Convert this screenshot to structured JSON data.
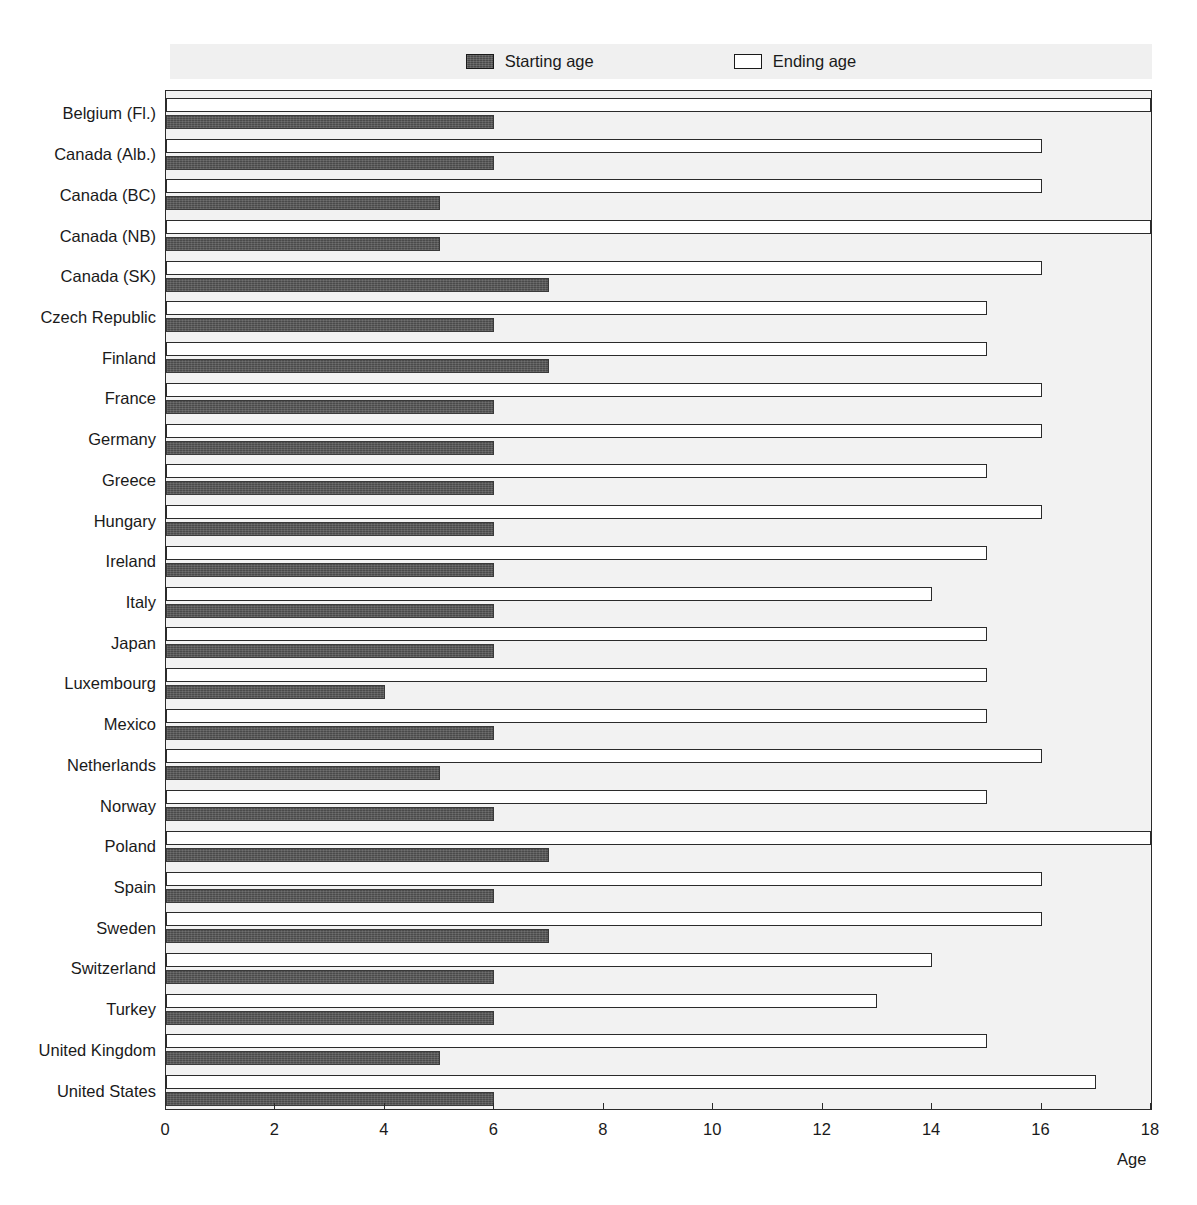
{
  "legend": {
    "items": [
      {
        "label": "Starting age",
        "swatch": "filled-dark"
      },
      {
        "label": "Ending age",
        "swatch": "outlined-white"
      }
    ]
  },
  "axis": {
    "x_title": "Age",
    "x_ticks": [
      "0",
      "2",
      "4",
      "6",
      "8",
      "10",
      "12",
      "14",
      "16",
      "18"
    ]
  },
  "colors": {
    "starting_bar": "#4a4a4a",
    "ending_bar": "#ffffff",
    "bar_outline": "#2b2b2b",
    "plot_background": "#f2f2f2",
    "legend_background": "#f0f0f0",
    "text": "#1a1a1a"
  },
  "chart_data": {
    "type": "bar",
    "orientation": "horizontal",
    "title": "",
    "xlabel": "Age",
    "ylabel": "",
    "xlim": [
      0,
      18
    ],
    "xticks": [
      0,
      2,
      4,
      6,
      8,
      10,
      12,
      14,
      16,
      18
    ],
    "grid": false,
    "legend_position": "top",
    "categories": [
      "Belgium (Fl.)",
      "Canada (Alb.)",
      "Canada (BC)",
      "Canada (NB)",
      "Canada (SK)",
      "Czech Republic",
      "Finland",
      "France",
      "Germany",
      "Greece",
      "Hungary",
      "Ireland",
      "Italy",
      "Japan",
      "Luxembourg",
      "Mexico",
      "Netherlands",
      "Norway",
      "Poland",
      "Spain",
      "Sweden",
      "Switzerland",
      "Turkey",
      "United Kingdom",
      "United States"
    ],
    "series": [
      {
        "name": "Ending age",
        "values": [
          18,
          16,
          16,
          18,
          16,
          15,
          15,
          16,
          16,
          15,
          16,
          15,
          14,
          15,
          15,
          15,
          16,
          15,
          18,
          16,
          16,
          14,
          13,
          15,
          17
        ]
      },
      {
        "name": "Starting age",
        "values": [
          6,
          6,
          5,
          5,
          7,
          6,
          7,
          6,
          6,
          6,
          6,
          6,
          6,
          6,
          4,
          6,
          5,
          6,
          7,
          6,
          7,
          6,
          6,
          5,
          6
        ]
      }
    ]
  }
}
